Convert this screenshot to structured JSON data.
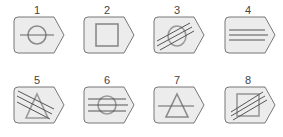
{
  "figure": {
    "colors": {
      "card_fill": "#ececec",
      "card_stroke": "#777777",
      "shape_stroke": "#8a8a8a",
      "line_stroke": "#555555"
    },
    "cards": [
      {
        "label": "1",
        "shape": "circle",
        "lines": "horizontal-1"
      },
      {
        "label": "2",
        "shape": "square",
        "lines": "none"
      },
      {
        "label": "3",
        "shape": "circle",
        "lines": "diagonal-3"
      },
      {
        "label": "4",
        "shape": "none",
        "lines": "horizontal-3"
      },
      {
        "label": "5",
        "shape": "triangle",
        "lines": "diagonal-down-3"
      },
      {
        "label": "6",
        "shape": "circle",
        "lines": "horizontal-3"
      },
      {
        "label": "7",
        "shape": "triangle",
        "lines": "horizontal-1"
      },
      {
        "label": "8",
        "shape": "square",
        "lines": "diagonal-3"
      }
    ]
  }
}
